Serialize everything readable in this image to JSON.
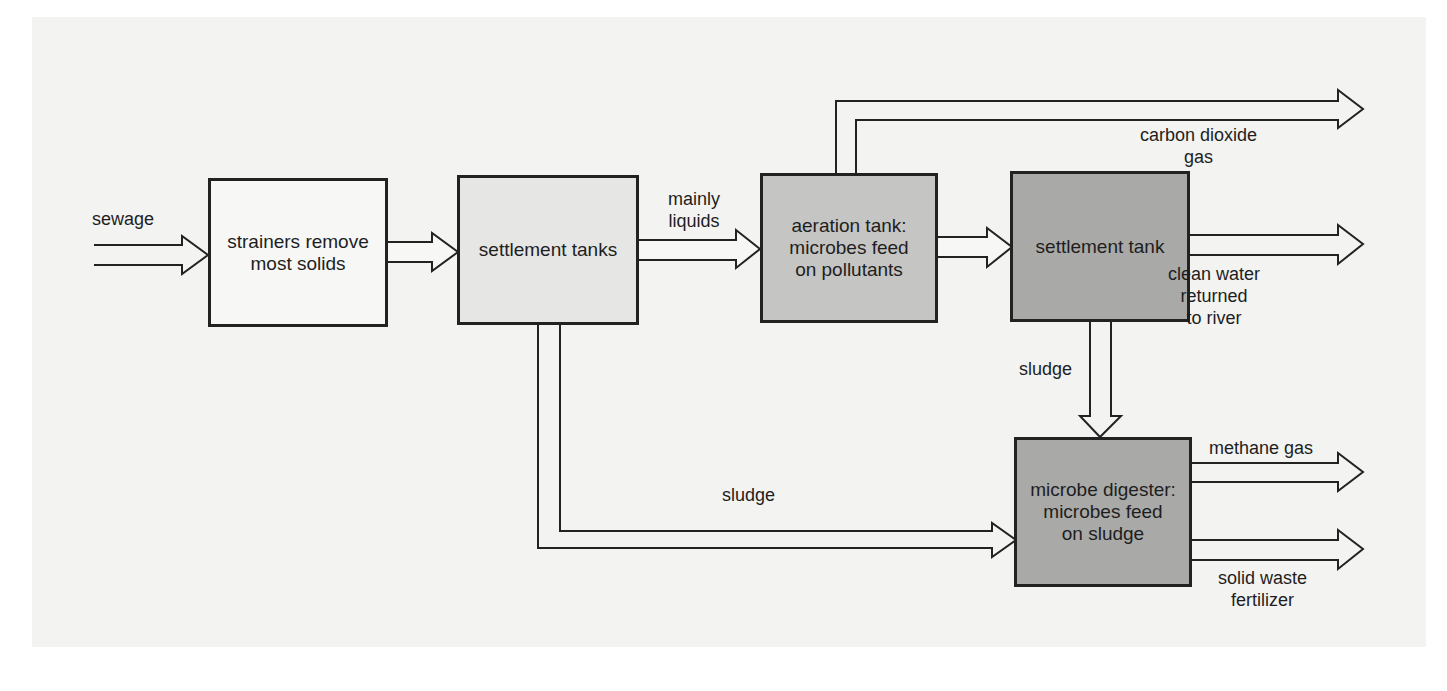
{
  "diagram": {
    "title": "",
    "nodes": [
      {
        "id": "strainers",
        "label": "strainers remove\nmost solids"
      },
      {
        "id": "settlement_tanks",
        "label": "settlement tanks"
      },
      {
        "id": "aeration_tank",
        "label": "aeration tank:\nmicrobes feed\non pollutants"
      },
      {
        "id": "settlement_tank",
        "label": "settlement tank"
      },
      {
        "id": "digester",
        "label": "microbe digester:\nmicrobes feed\non sludge"
      }
    ],
    "edge_labels": {
      "sewage": "sewage",
      "mainly_liquids": "mainly\nliquids",
      "co2": "carbon dioxide\ngas",
      "clean_water": "clean water\nreturned\nto river",
      "sludge_down": "sludge",
      "sludge_bottom": "sludge",
      "methane": "methane gas",
      "solid_waste": "solid waste\nfertilizer"
    },
    "edges": [
      {
        "from": "input",
        "to": "strainers",
        "label": "sewage"
      },
      {
        "from": "strainers",
        "to": "settlement_tanks",
        "label": ""
      },
      {
        "from": "settlement_tanks",
        "to": "aeration_tank",
        "label": "mainly liquids"
      },
      {
        "from": "aeration_tank",
        "to": "output",
        "label": "carbon dioxide gas"
      },
      {
        "from": "aeration_tank",
        "to": "settlement_tank",
        "label": ""
      },
      {
        "from": "settlement_tank",
        "to": "output",
        "label": "clean water returned to river"
      },
      {
        "from": "settlement_tank",
        "to": "digester",
        "label": "sludge"
      },
      {
        "from": "settlement_tanks",
        "to": "digester",
        "label": "sludge"
      },
      {
        "from": "digester",
        "to": "output",
        "label": "methane gas"
      },
      {
        "from": "digester",
        "to": "output",
        "label": "solid waste fertilizer"
      }
    ],
    "colors": {
      "background": "#f3f3f2",
      "strainers": "#f7f7f6",
      "settlement_tanks": "#e6e6e5",
      "aeration_tank": "#c5c5c4",
      "settlement_tank": "#a9a9a8",
      "digester": "#a9a9a8",
      "line": "#222222"
    }
  }
}
